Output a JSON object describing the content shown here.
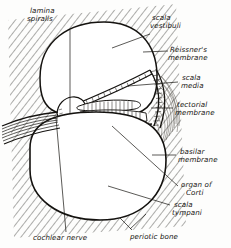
{
  "figure": {
    "style": "hand-drawn ink line diagram",
    "ink_color": "#14120f",
    "background_color": "#fdfdfc"
  },
  "labels": [
    {
      "id": "lamina-spiralis",
      "line1": "lamina",
      "line2": "spiralis",
      "x": 30,
      "y": 13
    },
    {
      "id": "scala-vestibuli",
      "line1": "scala",
      "line2": "vestibuli",
      "x": 152,
      "y": 20
    },
    {
      "id": "reissners-membrane",
      "line1": "Reissner's",
      "line2": "membrane",
      "x": 170,
      "y": 48
    },
    {
      "id": "scala-media",
      "line1": "scala",
      "line2": "media",
      "x": 180,
      "y": 78
    },
    {
      "id": "tectorial-membrane",
      "line1": "tectorial",
      "line2": "membrane",
      "x": 175,
      "y": 105
    },
    {
      "id": "basilar-membrane",
      "line1": "basilar",
      "line2": "membrane",
      "x": 178,
      "y": 152
    },
    {
      "id": "organ-of-corti",
      "line1": "organ of",
      "line2": "Corti",
      "x": 180,
      "y": 186
    },
    {
      "id": "scala-tympani",
      "line1": "scala",
      "line2": "tympani",
      "x": 172,
      "y": 206
    },
    {
      "id": "cochlear-nerve",
      "line1": "cochlear nerve",
      "line2": "",
      "x": 33,
      "y": 239
    },
    {
      "id": "periotic-bone",
      "line1": "periotic bone",
      "line2": "",
      "x": 130,
      "y": 238
    }
  ],
  "structures": [
    {
      "id": "scala-vestibuli",
      "name": "scala vestibuli"
    },
    {
      "id": "scala-media",
      "name": "scala media"
    },
    {
      "id": "scala-tympani",
      "name": "scala tympani"
    },
    {
      "id": "reissners-membrane",
      "name": "Reissner's membrane"
    },
    {
      "id": "basilar-membrane",
      "name": "basilar membrane"
    },
    {
      "id": "tectorial-membrane",
      "name": "tectorial membrane"
    },
    {
      "id": "organ-of-corti",
      "name": "organ of Corti"
    },
    {
      "id": "lamina-spiralis",
      "name": "lamina spiralis"
    },
    {
      "id": "cochlear-nerve",
      "name": "cochlear nerve"
    },
    {
      "id": "periotic-bone",
      "name": "periotic bone"
    },
    {
      "id": "spiral-ligament",
      "name": "spiral ligament"
    }
  ]
}
